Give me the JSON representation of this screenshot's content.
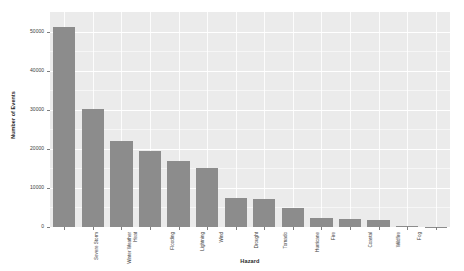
{
  "chart_data": {
    "type": "bar",
    "title": "",
    "xlabel": "Hazard",
    "ylabel": "Number of Events",
    "ylim": [
      0,
      55000
    ],
    "yticks": [
      0,
      10000,
      20000,
      30000,
      40000,
      50000
    ],
    "ytick_labels": [
      "0",
      "10000",
      "20000",
      "30000",
      "40000",
      "50000"
    ],
    "grid": true,
    "legend": "none",
    "orientation": "vertical",
    "bar_color": "#8c8c8c",
    "panel_color": "#ebebeb",
    "categories": [
      "Severe Storm",
      "Winter Weather",
      "Heat",
      "Flooding",
      "Lightning",
      "Wind",
      "Drought",
      "Tornado",
      "Hurricane",
      "Fire",
      "Coastal",
      "Wildfire",
      "Fog",
      "Thunderstorm"
    ],
    "values": [
      51200,
      30100,
      22000,
      19400,
      16800,
      15200,
      7400,
      7100,
      4800,
      2300,
      2000,
      1800,
      150,
      100
    ]
  }
}
